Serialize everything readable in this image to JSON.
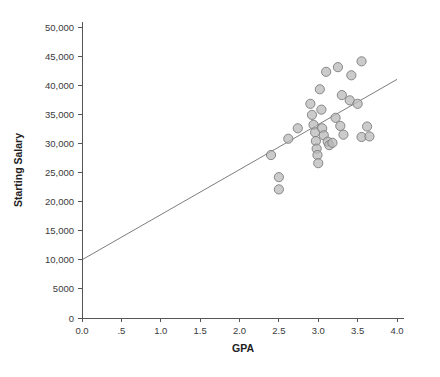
{
  "chart_data": {
    "type": "scatter",
    "title": "",
    "xlabel": "GPA",
    "ylabel": "Starting Salary",
    "xlim": [
      0.0,
      4.0
    ],
    "ylim": [
      0,
      50000
    ],
    "grid": false,
    "legend": null,
    "xticks": [
      0.0,
      0.5,
      1.0,
      1.5,
      2.0,
      2.5,
      3.0,
      3.5,
      4.0
    ],
    "xtick_labels": [
      "0.0",
      ".5",
      "1.0",
      "1.5",
      "2.0",
      "2.5",
      "3.0",
      "3.5",
      "4.0"
    ],
    "yticks": [
      0,
      5000,
      10000,
      15000,
      20000,
      25000,
      30000,
      35000,
      40000,
      45000,
      50000
    ],
    "ytick_labels": [
      "0",
      "5000",
      "10,000",
      "15,000",
      "20,000",
      "25,000",
      "30,000",
      "35,000",
      "40,000",
      "45,000",
      "50,000"
    ],
    "marker": {
      "shape": "circle",
      "fill_color": "#b9b9b9",
      "edge_color": "#7d7d7d",
      "size_px": 4.6
    },
    "fit_line": {
      "type": "linear-regression",
      "color": "#6e6e6e",
      "x_start": 0.0,
      "y_start": 10000,
      "x_end": 4.0,
      "y_end": 41000
    },
    "points": [
      {
        "x": 2.4,
        "y": 28000
      },
      {
        "x": 2.5,
        "y": 24200
      },
      {
        "x": 2.5,
        "y": 22100
      },
      {
        "x": 2.62,
        "y": 30800
      },
      {
        "x": 2.74,
        "y": 32600
      },
      {
        "x": 2.9,
        "y": 36800
      },
      {
        "x": 2.92,
        "y": 34900
      },
      {
        "x": 2.94,
        "y": 33200
      },
      {
        "x": 2.96,
        "y": 31900
      },
      {
        "x": 2.97,
        "y": 30400
      },
      {
        "x": 2.98,
        "y": 29100
      },
      {
        "x": 2.99,
        "y": 28000
      },
      {
        "x": 3.0,
        "y": 26600
      },
      {
        "x": 3.02,
        "y": 39300
      },
      {
        "x": 3.04,
        "y": 35800
      },
      {
        "x": 3.05,
        "y": 32600
      },
      {
        "x": 3.07,
        "y": 31400
      },
      {
        "x": 3.1,
        "y": 42300
      },
      {
        "x": 3.12,
        "y": 30300
      },
      {
        "x": 3.14,
        "y": 29700
      },
      {
        "x": 3.18,
        "y": 30100
      },
      {
        "x": 3.22,
        "y": 34400
      },
      {
        "x": 3.25,
        "y": 43100
      },
      {
        "x": 3.28,
        "y": 33000
      },
      {
        "x": 3.3,
        "y": 38300
      },
      {
        "x": 3.32,
        "y": 31500
      },
      {
        "x": 3.4,
        "y": 37400
      },
      {
        "x": 3.42,
        "y": 41700
      },
      {
        "x": 3.5,
        "y": 36800
      },
      {
        "x": 3.55,
        "y": 44100
      },
      {
        "x": 3.55,
        "y": 31100
      },
      {
        "x": 3.62,
        "y": 32900
      },
      {
        "x": 3.65,
        "y": 31200
      }
    ]
  },
  "axes": {
    "x_title": "GPA",
    "y_title": "Starting Salary"
  }
}
